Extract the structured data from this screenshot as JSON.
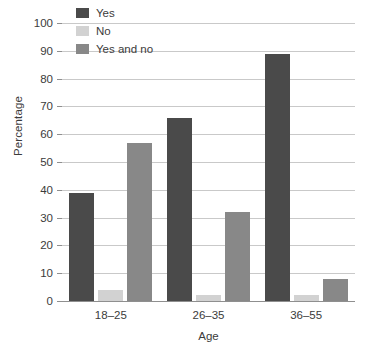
{
  "chart_data": {
    "type": "bar",
    "title": "",
    "xlabel": "Age",
    "ylabel": "Percentage",
    "categories": [
      "18–25",
      "26–35",
      "36–55"
    ],
    "series": [
      {
        "name": "Yes",
        "color": "#4a4a4a",
        "values": [
          39,
          66,
          89
        ]
      },
      {
        "name": "No",
        "color": "#d2d2d2",
        "values": [
          4,
          2,
          2
        ]
      },
      {
        "name": "Yes and no",
        "color": "#888888",
        "values": [
          57,
          32,
          8
        ]
      }
    ],
    "ylim": [
      0,
      100
    ],
    "yticks": [
      0,
      10,
      20,
      30,
      40,
      50,
      60,
      70,
      80,
      90,
      100
    ],
    "ytick_labels": [
      "0",
      "10",
      "20",
      "30",
      "40",
      "50",
      "60",
      "70",
      "80",
      "90",
      "100"
    ],
    "grid": true,
    "grid_axis": "y",
    "legend_position": "upper left"
  }
}
